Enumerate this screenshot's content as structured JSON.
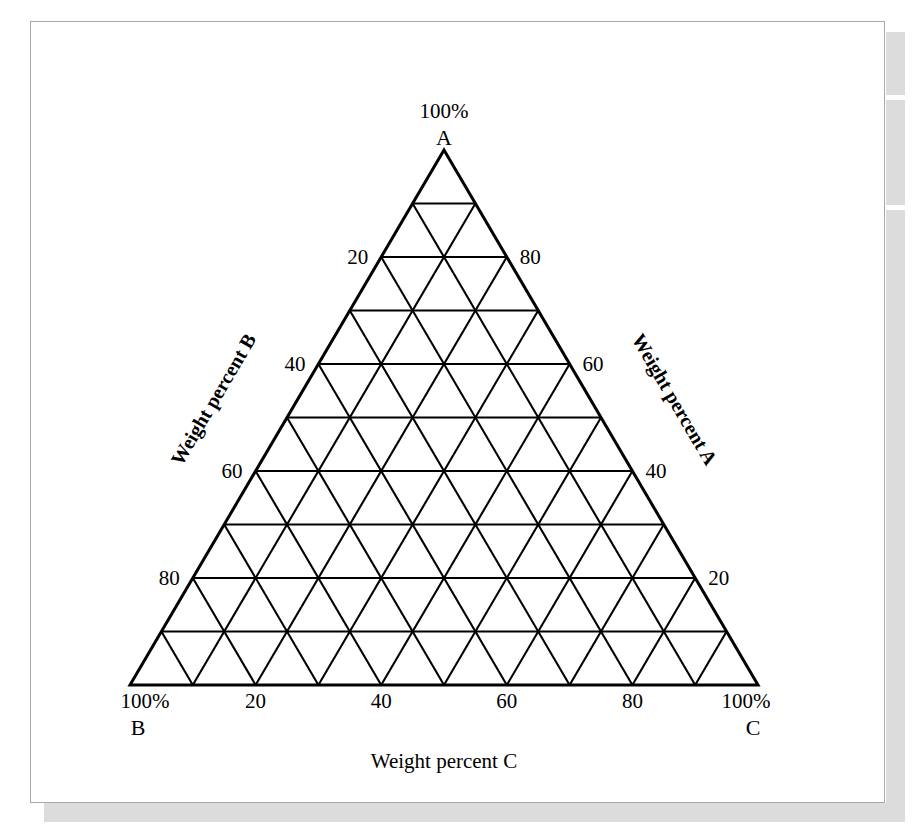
{
  "figure": {
    "type": "ternary-diagram",
    "background_color": "#ffffff",
    "line_color": "#000000",
    "border_color": "#a9a9a9",
    "shadow_color": "#dcdcdc"
  },
  "apex": {
    "percent": "100%",
    "component": "A"
  },
  "bottom_left": {
    "percent": "100%",
    "component": "B"
  },
  "bottom_right": {
    "percent": "100%",
    "component": "C"
  },
  "axis_titles": {
    "bottom": "Weight percent C",
    "left": "Weight percent B",
    "right": "Weight percent A"
  },
  "ticks": {
    "bottom": [
      "20",
      "40",
      "60",
      "80"
    ],
    "left": [
      "20",
      "40",
      "60",
      "80"
    ],
    "right": [
      "20",
      "40",
      "60",
      "80"
    ]
  },
  "chart_data": {
    "type": "ternary",
    "title": "",
    "subtitle": "",
    "axes": [
      {
        "name": "A",
        "label": "Weight percent A",
        "side": "right",
        "vertex": "top",
        "vertex_label": "100% A",
        "range": [
          0,
          100
        ],
        "tick_interval": 20,
        "tick_labels": [
          "20",
          "40",
          "60",
          "80"
        ],
        "tick_values": [
          20,
          40,
          60,
          80
        ],
        "direction": "increases upward toward apex A"
      },
      {
        "name": "B",
        "label": "Weight percent B",
        "side": "left",
        "vertex": "bottom-left",
        "vertex_label": "100% B",
        "range": [
          0,
          100
        ],
        "tick_interval": 20,
        "tick_labels": [
          "20",
          "40",
          "60",
          "80"
        ],
        "tick_values": [
          20,
          40,
          60,
          80
        ],
        "direction": "increases downward toward vertex B"
      },
      {
        "name": "C",
        "label": "Weight percent C",
        "side": "bottom",
        "vertex": "bottom-right",
        "vertex_label": "100% C",
        "range": [
          0,
          100
        ],
        "tick_interval": 20,
        "tick_labels": [
          "20",
          "40",
          "60",
          "80"
        ],
        "tick_values": [
          20,
          40,
          60,
          80
        ],
        "direction": "increases left to right toward vertex C"
      }
    ],
    "grid": {
      "on": true,
      "subdivisions": 10,
      "spacing_percent": 10,
      "families": [
        "parallel-to-base",
        "parallel-to-left-edge",
        "parallel-to-right-edge"
      ],
      "lines_per_family": 9
    },
    "legend": null,
    "series": [],
    "data_points": [],
    "annotations": []
  }
}
